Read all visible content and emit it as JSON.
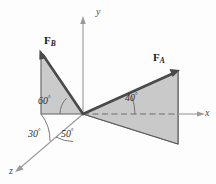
{
  "figure": {
    "type": "3d-vector-diagram",
    "title": "",
    "background_color": "#fdfdfd",
    "plane_fill_color": "#c9c9c9",
    "plane_edge_color": "#555555",
    "vector_color": "#4a4a4a",
    "axis_color": "#9a9a9a"
  },
  "axes": [
    {
      "name": "y-axis",
      "label": "y",
      "direction": "up"
    },
    {
      "name": "x-axis",
      "label": "x",
      "direction": "right"
    },
    {
      "name": "z-axis",
      "label": "z",
      "direction": "lower-left"
    }
  ],
  "vectors": [
    {
      "name": "force-a",
      "label": "F",
      "subscript": "A",
      "full_label": "F_A"
    },
    {
      "name": "force-b",
      "label": "F",
      "subscript": "B",
      "full_label": "F_B"
    }
  ],
  "angles": [
    {
      "name": "angle-60",
      "value": "60",
      "unit": "°",
      "text": "60",
      "belongs_to": "F_B from horizontal in its plane"
    },
    {
      "name": "angle-30",
      "value": "30",
      "unit": "°",
      "text": "30",
      "belongs_to": "F_B plane from z-axis"
    },
    {
      "name": "angle-50",
      "value": "50",
      "unit": "°",
      "text": "50",
      "belongs_to": "F_A plane from z-axis"
    },
    {
      "name": "angle-40",
      "value": "40",
      "unit": "°",
      "text": "40",
      "belongs_to": "F_A from horizontal in its plane"
    }
  ],
  "degree_symbol": "°"
}
